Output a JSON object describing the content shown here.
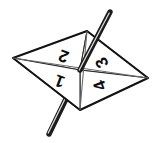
{
  "figure": {
    "name": "four-sided-spinner",
    "canvas": {
      "width": 161,
      "height": 143,
      "background": "#ffffff"
    }
  },
  "colors": {
    "outline": "#1a1a1a",
    "face_fill": "#ffffff",
    "divider": "#555555",
    "pin_dark": "#1c1c1c",
    "pin_mid": "#4a4a4a",
    "pin_light": "#d8d8d8",
    "label_color": "#0d0d0d"
  },
  "body_shape": {
    "type": "rhombus",
    "vertices": [
      {
        "id": "left",
        "x": 13,
        "y": 58
      },
      {
        "id": "top",
        "x": 87,
        "y": 31
      },
      {
        "id": "right",
        "x": 148,
        "y": 78
      },
      {
        "id": "bottom",
        "x": 80,
        "y": 110
      }
    ],
    "center": {
      "x": 80,
      "y": 70
    }
  },
  "dividers": [
    {
      "name": "divider-left-right",
      "x1": 13,
      "y1": 58,
      "x2": 148,
      "y2": 78
    },
    {
      "name": "divider-top-bottom",
      "x1": 87,
      "y1": 31,
      "x2": 80,
      "y2": 110
    }
  ],
  "sectors": [
    {
      "name": "sector-2",
      "label": "2",
      "position": "upper-left",
      "label_x": 64,
      "label_y": 55,
      "rotation": 200
    },
    {
      "name": "sector-1",
      "label": "1",
      "position": "lower-left",
      "label_x": 60,
      "label_y": 80,
      "rotation": 200
    },
    {
      "name": "sector-3",
      "label": "3",
      "position": "upper-right",
      "label_x": 103,
      "label_y": 62,
      "rotation": 245
    },
    {
      "name": "sector-4",
      "label": "4",
      "position": "lower-right",
      "label_x": 101,
      "label_y": 85,
      "rotation": 250
    }
  ],
  "spindle": {
    "name": "spinner-pin",
    "top": {
      "x": 110,
      "y": 12
    },
    "bottom": {
      "x": 49,
      "y": 134
    },
    "width": 5
  }
}
